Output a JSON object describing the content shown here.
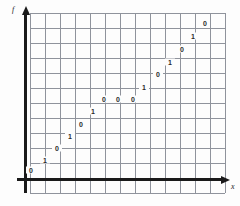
{
  "figure": {
    "axes": {
      "y_label": "f",
      "x_label": "x",
      "y_axis_name": "vertical-axis",
      "x_axis_name": "horizontal-axis"
    },
    "grid": {
      "spacing_px": 15,
      "left_px": 30,
      "top_px": 13,
      "right_px": 225,
      "bottom_px": 193,
      "columns": 13,
      "rows": 12,
      "line_color": "#8f939c",
      "background": "#fdfdfd"
    },
    "axis_positions": {
      "y_axis_x_px": 24,
      "x_axis_y_px": 178
    }
  },
  "chart_data": {
    "type": "scatter",
    "title": "",
    "xlabel": "x",
    "ylabel": "f",
    "grid": true,
    "legend": null,
    "annotations": [
      {
        "label": "0",
        "x_px": 31,
        "y_px": 170
      },
      {
        "label": "1",
        "x_px": 45,
        "y_px": 160
      },
      {
        "label": "0",
        "x_px": 57,
        "y_px": 148
      },
      {
        "label": "1",
        "x_px": 70,
        "y_px": 136
      },
      {
        "label": "0",
        "x_px": 81,
        "y_px": 124
      },
      {
        "label": "1",
        "x_px": 93,
        "y_px": 111
      },
      {
        "label": "0",
        "x_px": 104,
        "y_px": 99
      },
      {
        "label": "0",
        "x_px": 118,
        "y_px": 99
      },
      {
        "label": "0",
        "x_px": 133,
        "y_px": 99
      },
      {
        "label": "1",
        "x_px": 144,
        "y_px": 87
      },
      {
        "label": "0",
        "x_px": 158,
        "y_px": 74
      },
      {
        "label": "1",
        "x_px": 170,
        "y_px": 62
      },
      {
        "label": "0",
        "x_px": 182,
        "y_px": 49
      },
      {
        "label": "1",
        "x_px": 193,
        "y_px": 36
      },
      {
        "label": "0",
        "x_px": 205,
        "y_px": 23
      }
    ],
    "x": [
      31,
      45,
      57,
      70,
      81,
      93,
      104,
      118,
      133,
      144,
      158,
      170,
      182,
      193,
      205
    ],
    "values": [
      "0",
      "1",
      "0",
      "1",
      "0",
      "1",
      "0",
      "0",
      "0",
      "1",
      "0",
      "1",
      "0",
      "1",
      "0"
    ]
  }
}
